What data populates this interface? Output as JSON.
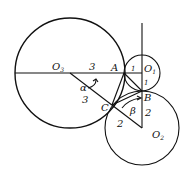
{
  "diagram": {
    "stroke_color": "#111111",
    "background": "#ffffff",
    "circles": [
      {
        "name": "O3",
        "cx": 70,
        "cy": 73,
        "r": 55
      },
      {
        "name": "O1",
        "cx": 142,
        "cy": 73,
        "r": 18
      },
      {
        "name": "O2",
        "cx": 142,
        "cy": 128,
        "r": 37
      }
    ],
    "points": {
      "A": {
        "label": "A",
        "x": 124,
        "y": 73
      },
      "B": {
        "label": "B",
        "x": 142,
        "y": 91
      },
      "C": {
        "label": "C",
        "x": 112,
        "y": 105
      }
    },
    "labels": {
      "O3": "O",
      "O3_sub": "3",
      "O1": "O",
      "O1_sub": "1",
      "O2": "O",
      "O2_sub": "2",
      "A": "A",
      "B": "B",
      "C": "C",
      "O3A_length": "3",
      "O3C_length": "3",
      "AO1_length": "1",
      "O1B_length": "1",
      "BO2_length": "2",
      "CO2_length": "2",
      "alpha": "α",
      "beta": "β"
    }
  }
}
